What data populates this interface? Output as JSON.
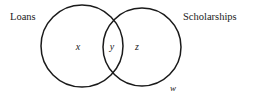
{
  "figure": {
    "type": "venn-diagram",
    "width": 254,
    "height": 100,
    "background_color": "#ffffff",
    "stroke_color": "#1a1a1a",
    "text_color": "#1a1a1a"
  },
  "sets": {
    "left": {
      "label": "Loans",
      "cx": 82,
      "cy": 46,
      "r": 41
    },
    "right": {
      "label": "Scholarships",
      "cx": 142,
      "cy": 47,
      "r": 39
    }
  },
  "regions": {
    "left_only": "x",
    "intersection": "y",
    "right_only": "z",
    "universe": "w"
  }
}
